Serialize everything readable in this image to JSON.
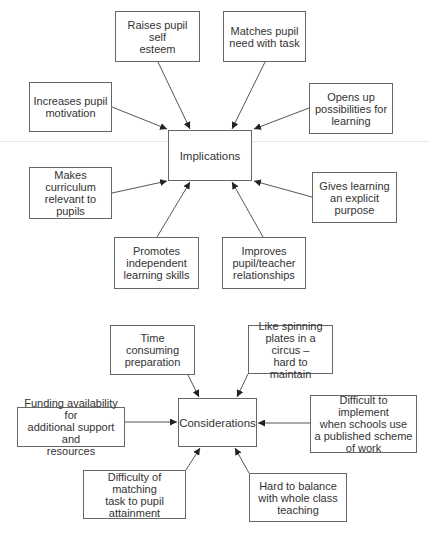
{
  "diagrams": [
    {
      "center": "Implications",
      "nodes": [
        {
          "id": "raises-self-esteem",
          "text": "Raises pupil self\nesteem"
        },
        {
          "id": "matches-need",
          "text": "Matches pupil\nneed with task"
        },
        {
          "id": "increases-motivation",
          "text": "Increases pupil\nmotivation"
        },
        {
          "id": "opens-possibilities",
          "text": "Opens up\npossibilities for\nlearning"
        },
        {
          "id": "makes-curriculum-relevant",
          "text": "Makes\ncurriculum\nrelevant to\npupils"
        },
        {
          "id": "gives-explicit-purpose",
          "text": "Gives learning\nan explicit\npurpose"
        },
        {
          "id": "promotes-independent",
          "text": "Promotes\nindependent\nlearning skills"
        },
        {
          "id": "improves-relationships",
          "text": "Improves\npupil/teacher\nrelationships"
        }
      ]
    },
    {
      "center": "Considerations",
      "nodes": [
        {
          "id": "time-consuming",
          "text": "Time\nconsuming\npreparation"
        },
        {
          "id": "spinning-plates",
          "text": "Like spinning\nplates in a circus –\nhard to maintain"
        },
        {
          "id": "funding",
          "text": "Funding availability for\nadditional support and\nresources"
        },
        {
          "id": "published-scheme",
          "text": "Difficult to implement\nwhen schools use\na published scheme\nof work"
        },
        {
          "id": "matching-task",
          "text": "Difficulty of matching\ntask to pupil\nattainment"
        },
        {
          "id": "whole-class",
          "text": "Hard to balance\nwith whole class\nteaching"
        }
      ]
    }
  ]
}
